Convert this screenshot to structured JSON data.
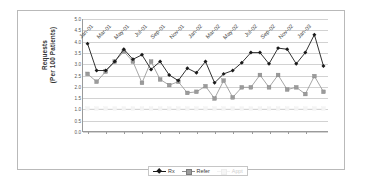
{
  "chart_data": {
    "type": "line",
    "title": "",
    "xlabel": "",
    "ylabel": "Requests\n(Per 100 Patients)",
    "ylim": [
      0.0,
      5.0
    ],
    "ytick_step": 0.5,
    "grid": true,
    "legend_position": "bottom-center",
    "ytick_labels": [
      "0.0",
      "0.5",
      "1.0",
      "1.5",
      "2.0",
      "2.5",
      "3.0",
      "3.5",
      "4.0",
      "4.5",
      "5.0"
    ],
    "x": [
      "Jan-01",
      "Feb-01",
      "Mar-01",
      "Apr-01",
      "May-01",
      "Jun-01",
      "Jul-01",
      "Aug-01",
      "Sep-01",
      "Oct-01",
      "Nov-01",
      "Dec-01",
      "Jan-02",
      "Feb-02",
      "Mar-02",
      "Apr-02",
      "May-02",
      "Jun-02",
      "Jul-02",
      "Aug-02",
      "Sep-02",
      "Oct-02",
      "Nov-02",
      "Dec-02",
      "Jan-03",
      "Feb-03",
      "Mar-03"
    ],
    "xtick_labels": [
      "Jan-01",
      "Mar-01",
      "May-01",
      "Jul-01",
      "Sep-01",
      "Nov-01",
      "Jan-02",
      "Mar-02",
      "May-02",
      "Jul-02",
      "Sep-02",
      "Nov-02",
      "Jan-03"
    ],
    "xtick_indices": [
      0,
      2,
      4,
      6,
      8,
      10,
      12,
      14,
      16,
      18,
      20,
      22,
      24
    ],
    "series": [
      {
        "name": "Rx",
        "color": "#1a1a1a",
        "marker": "diamond",
        "values": [
          3.9,
          2.7,
          2.7,
          3.1,
          3.65,
          3.2,
          3.4,
          2.75,
          3.1,
          2.5,
          2.25,
          2.8,
          2.6,
          3.1,
          2.15,
          2.55,
          2.7,
          3.05,
          3.5,
          3.5,
          3.0,
          3.7,
          3.65,
          3.0,
          3.5,
          4.3,
          2.9
        ]
      },
      {
        "name": "Refer",
        "color": "#9b9b9b",
        "marker": "square",
        "values": [
          2.55,
          2.2,
          2.65,
          3.1,
          3.55,
          3.1,
          2.15,
          3.1,
          2.3,
          2.05,
          2.2,
          1.7,
          1.75,
          2.0,
          1.45,
          2.25,
          1.5,
          1.95,
          1.95,
          2.5,
          1.95,
          2.5,
          1.85,
          1.95,
          1.65,
          2.45,
          1.75
        ]
      },
      {
        "name": "Appt",
        "color": "#f4f4f4",
        "marker": "square",
        "values": [
          1.0,
          1.0,
          1.0,
          1.0,
          1.0,
          1.0,
          1.0,
          1.0,
          1.0,
          1.0,
          1.0,
          1.0,
          1.0,
          1.0,
          1.0,
          1.0,
          1.0,
          1.0,
          1.0,
          1.0,
          1.0,
          1.0,
          1.0,
          1.0,
          1.0,
          1.0,
          1.0
        ]
      }
    ]
  },
  "legend": {
    "items": [
      {
        "label": "Rx"
      },
      {
        "label": "Refer"
      },
      {
        "label": "Appt"
      }
    ]
  }
}
